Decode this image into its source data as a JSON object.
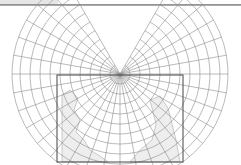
{
  "figure": {
    "type": "map-projection-graticule",
    "projection_shape": "polar-centered conic-like (horseshoe)",
    "pole": {
      "x": 120,
      "y": 74
    },
    "parallel_radii": [
      10,
      20,
      30,
      40,
      50,
      60,
      70,
      80,
      90,
      100,
      108
    ],
    "angle_span_deg": 150,
    "meridian_step_deg": 10,
    "colors": {
      "graticule": "#8c8c8c",
      "frame": "#444444",
      "land": "#eeeeee",
      "coast": "#9a9a9a",
      "rule": "#9a9a9a"
    },
    "frame_rect": {
      "x": 57,
      "y": 75,
      "width": 126,
      "height": 87
    }
  }
}
